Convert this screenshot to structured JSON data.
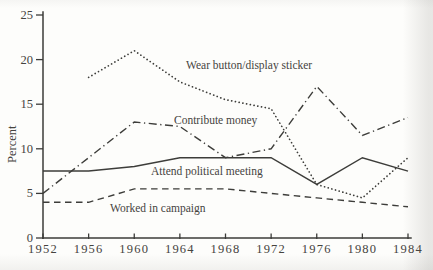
{
  "page": {
    "background": "#fdfdfb",
    "ink": "#3b3b38"
  },
  "chart_data": {
    "type": "line",
    "title": "",
    "xlabel": "",
    "ylabel": "Percent",
    "x": [
      1952,
      1956,
      1960,
      1964,
      1968,
      1972,
      1976,
      1980,
      1984
    ],
    "xlim": [
      1952,
      1984
    ],
    "ylim": [
      0,
      25
    ],
    "yticks": [
      0,
      5,
      10,
      15,
      20,
      25
    ],
    "grid": false,
    "legend_position": "inline",
    "series": [
      {
        "name": "Wear button/display sticker",
        "line_style": "dotted",
        "values": [
          null,
          18,
          21,
          17.5,
          15.5,
          14.5,
          6,
          4.5,
          9
        ]
      },
      {
        "name": "Contribute money",
        "line_style": "dashdot",
        "values": [
          5,
          9,
          13,
          12.5,
          9,
          10,
          17,
          11.5,
          13.5
        ]
      },
      {
        "name": "Attend political meeting",
        "line_style": "solid",
        "values": [
          7.5,
          7.5,
          8,
          9,
          9,
          9,
          6,
          9,
          7.5
        ]
      },
      {
        "name": "Worked in campaign",
        "line_style": "dashed",
        "values": [
          4,
          4,
          5.5,
          5.5,
          5.5,
          5,
          4.5,
          4,
          3.5
        ]
      }
    ],
    "inline_labels": [
      {
        "text": "Wear button/display sticker",
        "x": 186,
        "y": 69
      },
      {
        "text": "Contribute money",
        "x": 174,
        "y": 124
      },
      {
        "text": "Attend political meeting",
        "x": 151,
        "y": 175
      },
      {
        "text": "Worked in campaign",
        "x": 110,
        "y": 212
      }
    ]
  }
}
